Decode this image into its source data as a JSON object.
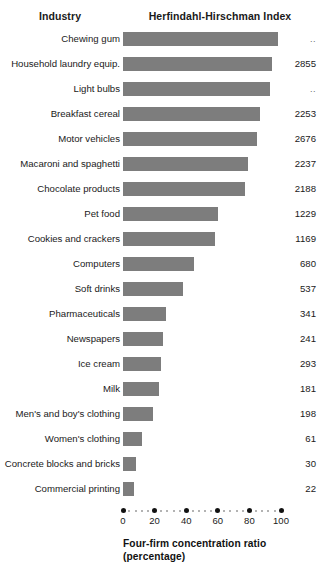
{
  "header": {
    "industry_label": "Industry",
    "index_label": "Herfindahl-Hirschman Index"
  },
  "axis": {
    "title_line1": "Four-firm concentration ratio",
    "title_line2": "(percentage)",
    "ticks": [
      "0",
      "20",
      "40",
      "60",
      "80",
      "100"
    ]
  },
  "chart_data": {
    "type": "bar",
    "orientation": "horizontal",
    "title": "",
    "xlabel": "Four-firm concentration ratio (percentage)",
    "ylabel": "Industry",
    "xlim": [
      0,
      100
    ],
    "xticks": [
      0,
      20,
      40,
      60,
      80,
      100
    ],
    "grid": false,
    "legend": "none",
    "bar_color": "#7d7d7d",
    "categories": [
      "Chewing gum",
      "Household laundry equip.",
      "Light bulbs",
      "Breakfast cereal",
      "Motor vehicles",
      "Macaroni and spaghetti",
      "Chocolate products",
      "Pet food",
      "Cookies and crackers",
      "Computers",
      "Soft drinks",
      "Pharmaceuticals",
      "Newspapers",
      "Ice cream",
      "Milk",
      "Men's and boy's clothing",
      "Women's clothing",
      "Concrete blocks and bricks",
      "Commercial printing"
    ],
    "values": [
      98,
      94,
      93,
      87,
      85,
      79,
      77,
      60,
      58,
      45,
      38,
      27,
      25,
      24,
      23,
      19,
      12,
      8,
      7
    ],
    "value_labels": [
      "..",
      "2855",
      "..",
      "2253",
      "2676",
      "2237",
      "2188",
      "1229",
      "1169",
      "680",
      "537",
      "341",
      "241",
      "293",
      "181",
      "198",
      "61",
      "30",
      "22"
    ],
    "value_series_name": "Herfindahl-Hirschman Index",
    "value_suppressed_marker": ".."
  }
}
